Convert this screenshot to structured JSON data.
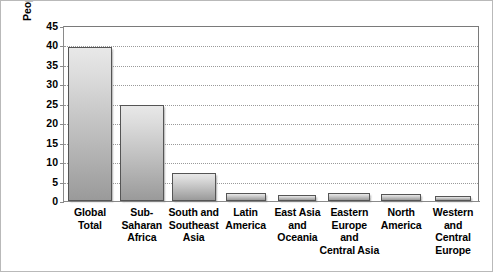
{
  "chart_data": {
    "type": "bar",
    "title": "",
    "xlabel": "",
    "ylabel": "People with AIDS (millions)",
    "categories": [
      "Global Total",
      "Sub-Saharan Africa",
      "South and Southeast Asia",
      "Latin America",
      "East Asia and Oceania",
      "Eastern Europe and Central Asia",
      "North America",
      "Western and Central Europe"
    ],
    "values": [
      39.5,
      24.8,
      7.2,
      2.0,
      1.5,
      2.0,
      1.7,
      1.3
    ],
    "ylim": [
      0,
      45
    ],
    "ytick_step": 5,
    "yticks": [
      0,
      5,
      10,
      15,
      20,
      25,
      30,
      35,
      40,
      45
    ],
    "ytick_labels": [
      "0",
      "5",
      "10",
      "15",
      "20",
      "25",
      "30",
      "35",
      "40",
      "45"
    ],
    "grid": true,
    "grid_axis": "y",
    "grid_style": "dotted",
    "legend": false,
    "legend_position": "none",
    "bar_color": "#c0c0c0",
    "bar_edge_color": "#555555",
    "grid_color": "#9a9a9a",
    "axis_color": "#8a8a8a",
    "text_color": "#000000",
    "background_color": "#ffffff"
  },
  "x_label_lines": [
    [
      "Global",
      "Total"
    ],
    [
      "Sub-",
      "Saharan",
      "Africa"
    ],
    [
      "South and",
      "Southeast",
      "Asia"
    ],
    [
      "Latin",
      "America"
    ],
    [
      "East Asia",
      "and",
      "Oceania"
    ],
    [
      "Eastern",
      "Europe",
      "and",
      "Central Asia"
    ],
    [
      "North",
      "America"
    ],
    [
      "Western",
      "and",
      "Central",
      "Europe"
    ]
  ]
}
